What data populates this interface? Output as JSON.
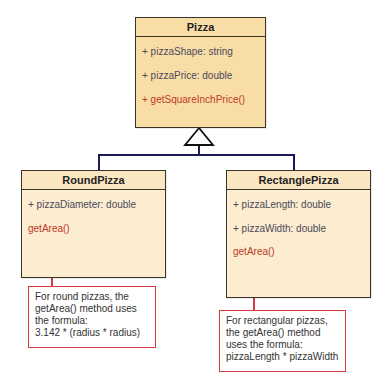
{
  "classes": {
    "pizza": {
      "name": "Pizza",
      "attributes": [
        "+ pizzaShape: string",
        "+ pizzaPrice: double"
      ],
      "methods": [
        "+ getSquareInchPrice()"
      ]
    },
    "round_pizza": {
      "name": "RoundPizza",
      "attributes": [
        "+ pizzaDiameter: double"
      ],
      "methods": [
        "getArea()"
      ]
    },
    "rectangle_pizza": {
      "name": "RectanglePizza",
      "attributes": [
        "+ pizzaLength: double",
        "+ pizzaWidth: double"
      ],
      "methods": [
        "getArea()"
      ]
    }
  },
  "notes": {
    "round": [
      "For round pizzas, the",
      "getArea() method uses",
      "the formula:",
      "3.142 * (radius * radius)"
    ],
    "rect": [
      "For rectangular pizzas,",
      "the getArea() method",
      "uses the formula:",
      "pizzaLength * pizzaWidth"
    ]
  },
  "relationships": [
    {
      "type": "generalization",
      "from": "RoundPizza",
      "to": "Pizza"
    },
    {
      "type": "generalization",
      "from": "RectanglePizza",
      "to": "Pizza"
    }
  ],
  "colors": {
    "parent_fill": "#f9dda6",
    "child_fill": "#fcecd0",
    "method_text": "#c0392b",
    "note_border": "#d9383e",
    "connector": "#1a1a5a"
  }
}
